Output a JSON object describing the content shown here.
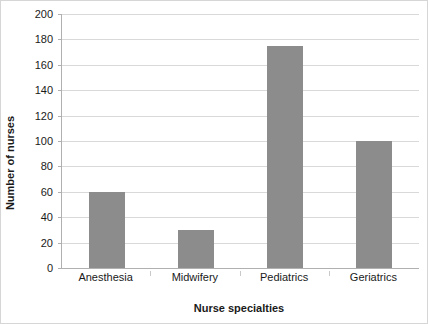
{
  "chart_data": {
    "type": "bar",
    "title": "",
    "subtitle": "",
    "categories": [
      "Anesthesia",
      "Midwifery",
      "Pediatrics",
      "Geriatrics"
    ],
    "values": [
      60,
      30,
      175,
      100
    ],
    "xlabel": "Nurse specialties",
    "ylabel": "Number of nurses",
    "ylim": [
      0,
      200
    ],
    "ytick_step": 20,
    "yticks": [
      0,
      20,
      40,
      60,
      80,
      100,
      120,
      140,
      160,
      180,
      200
    ],
    "ytick_labels": [
      "0",
      "20",
      "40",
      "60",
      "80",
      "100",
      "120",
      "140",
      "160",
      "180",
      "200"
    ],
    "grid": "horizontal",
    "legend": "none",
    "bar_color": "#8c8c8c",
    "gridline_color": "#d9d9d9",
    "axis_color": "#b0b0b0",
    "text_color": "#1a1a1a",
    "background_color": "#ffffff",
    "border_color": "#d6d6d6"
  }
}
